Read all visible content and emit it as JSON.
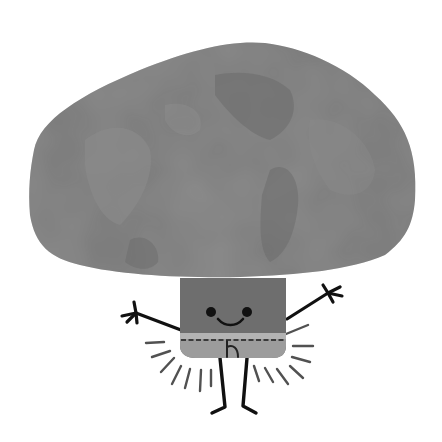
{
  "illustration": {
    "subject": "Happy cartoon mushroom character with arms raised",
    "colors": {
      "background": "#ffffff",
      "cap": "#777777",
      "cap_dark": "#6a6a6a",
      "cap_light": "#8a8a8a",
      "stem_upper": "#6e6e6e",
      "stem_lower": "#9a9a9a",
      "stem_band": "#b0b0b0",
      "ink": "#111111"
    },
    "expression": "smiling",
    "pose": "arms raised, standing",
    "decoration": "radiating sparkle lines around stem"
  }
}
